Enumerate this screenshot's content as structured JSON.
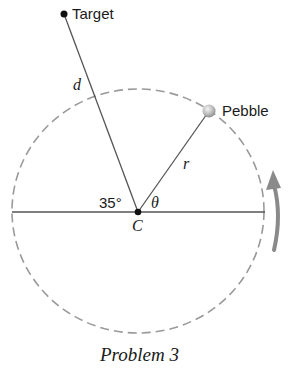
{
  "diagram": {
    "labels": {
      "target": "Target",
      "pebble": "Pebble",
      "distance": "d",
      "radius": "r",
      "angle_left": "35°",
      "angle_theta": "θ",
      "center": "C"
    },
    "caption": "Problem 3",
    "colors": {
      "line": "#555555",
      "dashed_circle": "#999999",
      "arrow": "#8a8a8a",
      "pebble_fill": "#c8c8c8"
    }
  }
}
